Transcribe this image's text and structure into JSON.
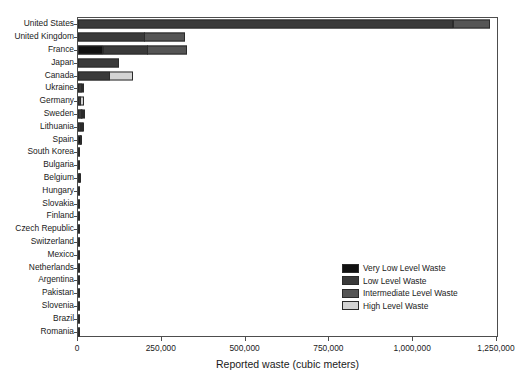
{
  "chart_data": {
    "type": "bar",
    "orientation": "horizontal",
    "stacked": true,
    "title": "",
    "xlabel": "Reported waste (cubic meters)",
    "ylabel": "",
    "xlim": [
      0,
      1250000
    ],
    "xticks": [
      0,
      250000,
      500000,
      750000,
      1000000,
      1250000
    ],
    "xtick_labels": [
      "0",
      "250,000",
      "500,000",
      "750,000",
      "1,000,000",
      "1,250,000"
    ],
    "grid": false,
    "legend_position": "lower right (inside axes)",
    "categories": [
      "United States",
      "United Kingdom",
      "France",
      "Japan",
      "Canada",
      "Ukraine",
      "Germany",
      "Sweden",
      "Lithuania",
      "Spain",
      "South Korea",
      "Bulgaria",
      "Belgium",
      "Hungary",
      "Slovakia",
      "Finland",
      "Czech Republic",
      "Switzerland",
      "Mexico",
      "Netherlands",
      "Argentina",
      "Pakistan",
      "Slovenia",
      "Brazil",
      "Romania"
    ],
    "series": [
      {
        "name": "Very Low Level Waste",
        "color": "#111111",
        "values": [
          0,
          0,
          75000,
          0,
          0,
          0,
          0,
          0,
          0,
          9000,
          0,
          0,
          3500,
          0,
          0,
          0,
          0,
          0,
          0,
          0,
          0,
          0,
          0,
          0,
          0
        ]
      },
      {
        "name": "Low Level Waste",
        "color": "#3a3a3a",
        "values": [
          1120000,
          200000,
          135000,
          122000,
          95000,
          13000,
          9000,
          12000,
          10000,
          2000,
          6500,
          5500,
          2000,
          5000,
          5000,
          4000,
          3500,
          2500,
          1500,
          1200,
          900,
          800,
          700,
          600,
          500
        ]
      },
      {
        "name": "Intermediate Level Waste",
        "color": "#555555",
        "values": [
          110000,
          120000,
          120000,
          0,
          0,
          0,
          0,
          2000,
          2000,
          0,
          0,
          0,
          0,
          0,
          0,
          0,
          0,
          0,
          0,
          0,
          0,
          0,
          0,
          0,
          0
        ]
      },
      {
        "name": "High Level Waste",
        "color": "#d4d4d4",
        "values": [
          0,
          0,
          0,
          0,
          70000,
          4000,
          10000,
          3000,
          1500,
          0,
          0,
          0,
          0,
          0,
          0,
          0,
          0,
          0,
          0,
          0,
          0,
          0,
          0,
          0,
          0
        ]
      }
    ]
  },
  "legend": {
    "items": [
      {
        "label": "Very Low Level Waste",
        "color": "#111111"
      },
      {
        "label": "Low Level Waste",
        "color": "#3a3a3a"
      },
      {
        "label": "Intermediate Level Waste",
        "color": "#555555"
      },
      {
        "label": "High Level Waste",
        "color": "#d4d4d4"
      }
    ]
  },
  "axes": {
    "x_title": "Reported waste (cubic meters)",
    "frame_color": "#4d4d4d"
  }
}
